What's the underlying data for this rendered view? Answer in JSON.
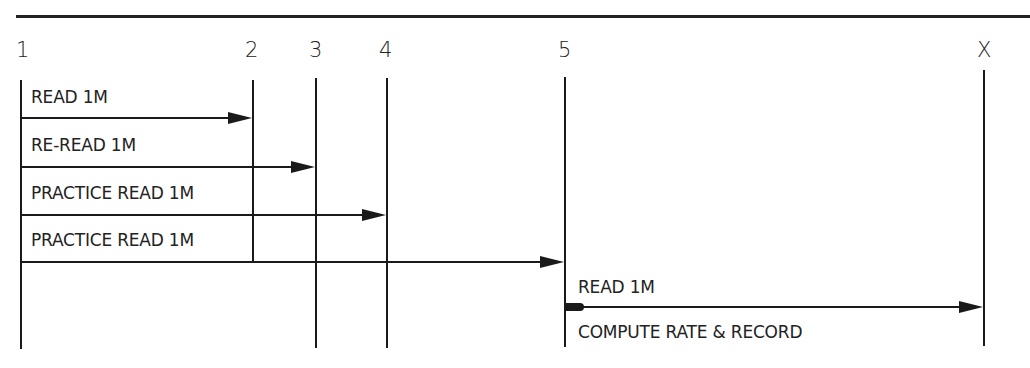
{
  "diagram": {
    "columns": [
      {
        "label": "1"
      },
      {
        "label": "2"
      },
      {
        "label": "3"
      },
      {
        "label": "4"
      },
      {
        "label": "5"
      },
      {
        "label": "X"
      }
    ],
    "steps": [
      {
        "label": "READ 1M",
        "from": "1",
        "to": "2"
      },
      {
        "label": "RE-READ 1M",
        "from": "1",
        "to": "3"
      },
      {
        "label": "PRACTICE READ 1M",
        "from": "1",
        "to": "4"
      },
      {
        "label": "PRACTICE READ 1M",
        "from": "1",
        "to": "5"
      },
      {
        "label": "READ 1M",
        "from": "5",
        "to": "X"
      }
    ],
    "final_note": "COMPUTE RATE & RECORD"
  }
}
